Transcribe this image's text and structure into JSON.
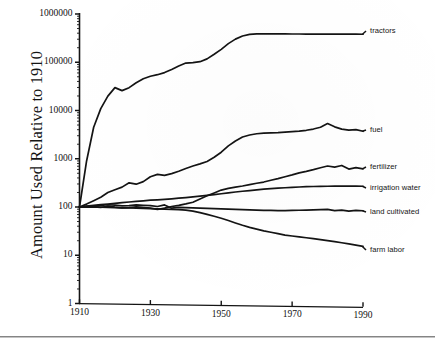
{
  "chart_data": {
    "type": "line",
    "title": "",
    "xlabel": "",
    "ylabel": "Amount Used Relative to 1910",
    "yscale": "log",
    "xlim": [
      1910,
      1990
    ],
    "ylim": [
      1,
      1000000
    ],
    "grid": false,
    "legend_position": "right-of-plot-inline",
    "xticks": [
      "1910",
      "1930",
      "1950",
      "1970",
      "1990"
    ],
    "xtick_values": [
      1910,
      1930,
      1950,
      1970,
      1990
    ],
    "yticks": [
      "1000000",
      "100000",
      "10000",
      "1000",
      "100",
      "10",
      "1"
    ],
    "ytick_values": [
      1000000,
      100000,
      10000,
      1000,
      100,
      10,
      1
    ],
    "x": [
      1910,
      1912,
      1914,
      1916,
      1918,
      1920,
      1922,
      1924,
      1926,
      1928,
      1930,
      1932,
      1934,
      1936,
      1938,
      1940,
      1942,
      1944,
      1946,
      1948,
      1950,
      1952,
      1954,
      1956,
      1958,
      1960,
      1962,
      1964,
      1966,
      1968,
      1970,
      1972,
      1974,
      1976,
      1978,
      1980,
      1982,
      1984,
      1986,
      1988,
      1990
    ],
    "series": [
      {
        "name": "tractors",
        "label": "tractors",
        "end_value": 400000,
        "values": [
          100,
          900,
          4500,
          11000,
          20000,
          30000,
          26000,
          30000,
          38000,
          46000,
          52000,
          56000,
          62000,
          72000,
          85000,
          98000,
          100000,
          105000,
          120000,
          150000,
          190000,
          250000,
          310000,
          360000,
          390000,
          400000,
          400000,
          400000,
          400000,
          400000,
          400000,
          400000,
          400000,
          400000,
          400000,
          400000,
          400000,
          400000,
          400000,
          400000,
          400000
        ]
      },
      {
        "name": "fuel",
        "label": "fuel",
        "end_value": 4000,
        "values": [
          100,
          115,
          135,
          160,
          200,
          230,
          260,
          320,
          300,
          340,
          430,
          480,
          460,
          500,
          560,
          640,
          720,
          800,
          900,
          1100,
          1400,
          1900,
          2400,
          2900,
          3200,
          3400,
          3500,
          3550,
          3600,
          3700,
          3800,
          3900,
          4050,
          4300,
          4700,
          5600,
          4800,
          4300,
          4100,
          4200,
          3900
        ]
      },
      {
        "name": "fertilizer",
        "label": "fertilizer",
        "end_value": 650,
        "values": [
          100,
          103,
          101,
          98,
          105,
          100,
          96,
          98,
          102,
          100,
          96,
          90,
          96,
          104,
          110,
          118,
          128,
          150,
          175,
          200,
          230,
          250,
          265,
          280,
          300,
          320,
          340,
          370,
          400,
          440,
          480,
          530,
          570,
          620,
          680,
          740,
          700,
          760,
          640,
          690,
          650
        ]
      },
      {
        "name": "irrigation water",
        "label": "irrigation water",
        "end_value": 280,
        "values": [
          100,
          104,
          108,
          112,
          116,
          120,
          124,
          128,
          132,
          136,
          140,
          143,
          146,
          150,
          155,
          160,
          166,
          172,
          178,
          185,
          193,
          202,
          210,
          218,
          226,
          234,
          242,
          248,
          254,
          260,
          266,
          270,
          274,
          277,
          279,
          281,
          282,
          283,
          284,
          284,
          283
        ]
      },
      {
        "name": "land cultivated",
        "label": "land cultivated",
        "end_value": 90,
        "values": [
          100,
          101,
          104,
          108,
          112,
          110,
          106,
          108,
          112,
          110,
          108,
          104,
          112,
          96,
          100,
          99,
          98,
          97,
          96,
          95,
          94,
          93,
          92,
          91,
          90,
          89,
          88,
          88,
          87,
          87,
          88,
          89,
          90,
          91,
          92,
          93,
          88,
          90,
          86,
          89,
          88
        ]
      },
      {
        "name": "farm labor",
        "label": "farm labor",
        "end_value": 16,
        "values": [
          100,
          100,
          101,
          100,
          99,
          98,
          97,
          97,
          96,
          95,
          94,
          93,
          92,
          91,
          90,
          88,
          84,
          78,
          72,
          66,
          60,
          54,
          48,
          43,
          39,
          36,
          33,
          31,
          29,
          27,
          26,
          25,
          24,
          23,
          22,
          21,
          20,
          19,
          18,
          17,
          16
        ]
      }
    ]
  },
  "labels": {
    "y_axis_title": "Amount Used Relative to 1910",
    "series": {
      "tractors": "tractors",
      "fuel": "fuel",
      "fertilizer": "fertilizer",
      "irrigation_water": "irrigation water",
      "land_cultivated": "land cultivated",
      "farm_labor": "farm labor"
    },
    "x_ticks": {
      "t1910": "1910",
      "t1930": "1930",
      "t1950": "1950",
      "t1970": "1970",
      "t1990": "1990"
    },
    "y_ticks": {
      "y1000000": "1000000",
      "y100000": "100000",
      "y10000": "10000",
      "y1000": "1000",
      "y100": "100",
      "y10": "10",
      "y1": "1"
    }
  },
  "style": {
    "ink": "#141414",
    "paper": "#ffffff"
  }
}
